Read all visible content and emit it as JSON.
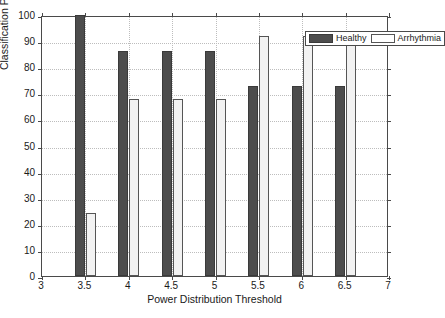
{
  "chart_data": {
    "type": "bar",
    "title": "",
    "xlabel": "Power Distribution Threshold",
    "ylabel": "Classification Performance (%)",
    "categories": [
      "3.5",
      "4",
      "4.5",
      "5",
      "5.5",
      "6",
      "6.5"
    ],
    "series": [
      {
        "name": "Healthy",
        "values": [
          100,
          86.4,
          86.4,
          86.4,
          72.7,
          72.7,
          72.7
        ],
        "color": "#4d4d4d"
      },
      {
        "name": "Arrhythmia",
        "values": [
          24,
          68,
          68,
          68,
          92,
          92,
          92
        ],
        "color": "#f2f2f2"
      }
    ],
    "xlim": [
      3,
      7
    ],
    "ylim": [
      0,
      100
    ],
    "x_ticks": [
      "3",
      "3.5",
      "4",
      "4.5",
      "5",
      "5.5",
      "6",
      "6.5",
      "7"
    ],
    "x_tick_values": [
      3,
      3.5,
      4,
      4.5,
      5,
      5.5,
      6,
      6.5,
      7
    ],
    "y_ticks": [
      "0",
      "10",
      "20",
      "30",
      "40",
      "50",
      "60",
      "70",
      "80",
      "90",
      "100"
    ],
    "y_tick_values": [
      0,
      10,
      20,
      30,
      40,
      50,
      60,
      70,
      80,
      90,
      100
    ],
    "grid": true,
    "legend_position": "top-right"
  },
  "legend": {
    "entries": [
      {
        "label": "Healthy"
      },
      {
        "label": "Arrhythmia"
      }
    ]
  }
}
